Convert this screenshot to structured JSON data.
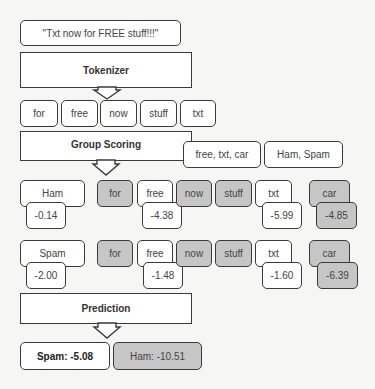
{
  "input": {
    "text": "\"Txt now for FREE stuff!!!\""
  },
  "stages": {
    "tokenizer": "Tokenizer",
    "group_scoring": "Group Scoring",
    "prediction": "Prediction"
  },
  "tokens": [
    "for",
    "free",
    "now",
    "stuff",
    "txt"
  ],
  "groups": {
    "vocab": "free, txt, car",
    "classes": "Ham, Spam"
  },
  "rows": [
    {
      "label": "Ham",
      "prior": "-0.14",
      "words": [
        {
          "text": "for",
          "active": false
        },
        {
          "text": "free",
          "active": true,
          "score": "-4.38"
        },
        {
          "text": "now",
          "active": false
        },
        {
          "text": "stuff",
          "active": false
        },
        {
          "text": "txt",
          "active": true,
          "score": "-5.99"
        },
        {
          "text": "car",
          "active": false,
          "score": "-4.85"
        }
      ]
    },
    {
      "label": "Spam",
      "prior": "-2.00",
      "words": [
        {
          "text": "for",
          "active": false
        },
        {
          "text": "free",
          "active": true,
          "score": "-1.48"
        },
        {
          "text": "now",
          "active": false
        },
        {
          "text": "stuff",
          "active": false
        },
        {
          "text": "txt",
          "active": true,
          "score": "-1.60"
        },
        {
          "text": "car",
          "active": false,
          "score": "-6.39"
        }
      ]
    }
  ],
  "results": {
    "spam": "Spam: -5.08",
    "ham": "Ham: -10.51"
  },
  "colors": {
    "active_fill": "#ffffff",
    "inactive_fill": "#c6c6c6",
    "border": "#3a3a3a",
    "background": "#f6f6f4"
  }
}
